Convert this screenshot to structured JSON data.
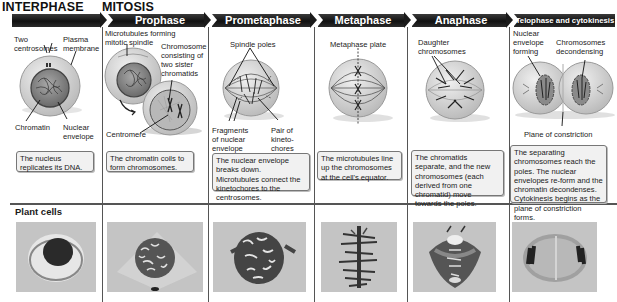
{
  "headers": {
    "interphase": "INTERPHASE",
    "mitosis": "MITOSIS"
  },
  "stages": [
    {
      "name": "Interphase",
      "labels": [
        "Two",
        "centrosomes",
        "Plasma",
        "membrane",
        "Chromatin",
        "Nuclear",
        "envelope"
      ],
      "description": "The nucleus replicates its DNA."
    },
    {
      "name": "Prophase",
      "labels": [
        "Microtubules forming",
        "mitotic spindle",
        "Chromosome",
        "consisting of",
        "two sister",
        "chromatids",
        "Centromere"
      ],
      "description": "The chromatin coils to form chromosomes."
    },
    {
      "name": "Prometaphase",
      "labels": [
        "Spindle poles",
        "Fragments",
        "of nuclear",
        "envelope",
        "Pair of",
        "kineto-",
        "chores"
      ],
      "description": "The nuclear envelope breaks down. Microtubules connect the kinetochores to the centrosomes."
    },
    {
      "name": "Metaphase",
      "labels": [
        "Metaphase plate"
      ],
      "description": "The microtubules line up the chromosomes at the cell's equator."
    },
    {
      "name": "Anaphase",
      "labels": [
        "Daughter",
        "chromosomes"
      ],
      "description": "The chromatids separate, and the new chromosomes (each derived from one chromatid) move towards the poles."
    },
    {
      "name": "Telophase and cytokinesis",
      "labels": [
        "Nuclear",
        "envelope",
        "forming",
        "Chromosomes",
        "decondensing",
        "Plane of constriction"
      ],
      "description": "The separating chromosomes reach the poles. The nuclear envelopes re-form and the chromatin decondenses. Cytokinesis begins as the plane of constriction forms."
    }
  ],
  "plant_cells": {
    "title": "Plant cells",
    "photos": [
      "interphase-micrograph",
      "prophase-micrograph",
      "prometaphase-micrograph",
      "metaphase-micrograph",
      "anaphase-micrograph",
      "telophase-micrograph"
    ]
  },
  "colors": {
    "band": "#1a1a1a",
    "band_text": "#ffffff",
    "cell_fill": "#d9d9d9",
    "box_fill": "#f1f1f1",
    "photo_bg": "#c4c4c4"
  }
}
